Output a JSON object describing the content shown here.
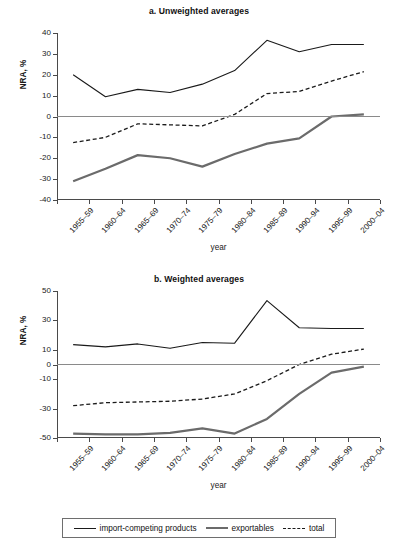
{
  "figure": {
    "y_axis_label": "NRA, %",
    "x_axis_label": "year"
  },
  "legend": {
    "items": [
      {
        "label": "import-competing products",
        "style": "solid-thin",
        "color": "#1a1a1a"
      },
      {
        "label": "exportables",
        "style": "solid-thick",
        "color": "#6b6b6b"
      },
      {
        "label": "total",
        "style": "dashed",
        "color": "#1a1a1a"
      }
    ]
  },
  "chart_data": [
    {
      "type": "line",
      "title": "a. Unweighted averages",
      "xlabel": "year",
      "ylabel": "NRA, %",
      "ylim": [
        -40,
        40
      ],
      "yticks": [
        40,
        30,
        20,
        10,
        0,
        -10,
        -20,
        -30,
        -40
      ],
      "ytick_labels": [
        "40",
        "30",
        "20",
        "10",
        "0",
        "-10",
        "-20",
        "-30",
        "-40"
      ],
      "grid": false,
      "legend_position": "bottom",
      "categories": [
        "1955–59",
        "1960–64",
        "1965–69",
        "1970–74",
        "1975–79",
        "1980–84",
        "1985–89",
        "1990–94",
        "1995–99",
        "2000–04"
      ],
      "series": [
        {
          "name": "import-competing products",
          "values": [
            20,
            9.5,
            13,
            11.5,
            15.5,
            22,
            36.5,
            31,
            34.5,
            34.5
          ]
        },
        {
          "name": "exportables",
          "values": [
            -31,
            -25,
            -18.5,
            -20,
            -24,
            -18,
            -13,
            -10.5,
            0,
            1
          ]
        },
        {
          "name": "total",
          "values": [
            -12.5,
            -10,
            -3.5,
            -4,
            -4.5,
            1,
            11,
            12,
            17,
            21.5
          ]
        }
      ]
    },
    {
      "type": "line",
      "title": "b. Weighted averages",
      "xlabel": "year",
      "ylabel": "NRA, %",
      "ylim": [
        -50,
        50
      ],
      "yticks": [
        50,
        30,
        10,
        0,
        -10,
        -30,
        -50
      ],
      "ytick_labels": [
        "50",
        "30",
        "10",
        "0",
        "-10",
        "-30",
        "-50"
      ],
      "grid": false,
      "legend_position": "bottom",
      "categories": [
        "1955–59",
        "1960–64",
        "1965–69",
        "1970–74",
        "1975–79",
        "1980–84",
        "1985–89",
        "1990–94",
        "1995–99",
        "2000–04"
      ],
      "series": [
        {
          "name": "import-competing products",
          "values": [
            13.5,
            12,
            14,
            11,
            15,
            14.5,
            43.5,
            25,
            24.5,
            24.5
          ]
        },
        {
          "name": "exportables",
          "values": [
            -47,
            -47.5,
            -47.5,
            -46.5,
            -43.5,
            -47,
            -37,
            -20,
            -5.5,
            -1.5
          ]
        },
        {
          "name": "total",
          "values": [
            -28,
            -26,
            -25.5,
            -25,
            -23.5,
            -20,
            -11,
            0,
            7,
            10.5
          ]
        }
      ]
    }
  ]
}
